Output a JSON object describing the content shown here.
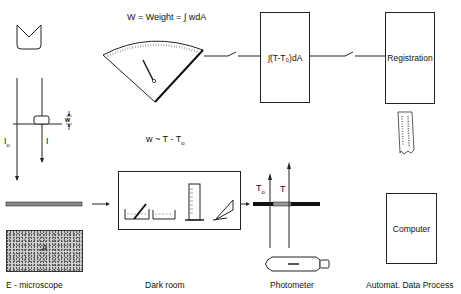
{
  "diagram": {
    "formula_weight": "W  =  Weight  = ∫ wdA",
    "formula_w": "w ~ T - T",
    "formula_w_sub": "o",
    "integrator_label": "∫(T-T₀)dA",
    "registration_label": "Registration",
    "computer_label": "Computer",
    "specimen_label": "A",
    "beam_label_io": "I",
    "beam_label_io_sub": "o",
    "beam_label_i": "I",
    "thickness_label": "w",
    "photometer_label_to": "T",
    "photometer_label_to_sub": "o",
    "photometer_label_t": "T",
    "stages": [
      {
        "label": "E - microscope"
      },
      {
        "label": "Dark room"
      },
      {
        "label": "Photometer"
      },
      {
        "label": "Automat. Data Process"
      }
    ]
  }
}
